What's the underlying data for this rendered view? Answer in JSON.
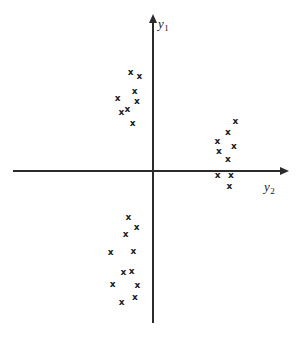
{
  "figure": {
    "background_color": "#ffffff",
    "axis_color": "#2b2b2b",
    "marker_color": "#1a1a1a",
    "marker_glyph": "x"
  },
  "axes": {
    "vertical": {
      "label": "y",
      "label_subscript": "1",
      "origin_x": 153,
      "top_y": 14,
      "bottom_y": 323,
      "arrow": "arrow-up"
    },
    "horizontal": {
      "label": "y",
      "label_subscript": "2",
      "origin_y": 171,
      "left_x": 13,
      "right_x": 288,
      "arrow": "arrow-right"
    }
  },
  "chart_data": {
    "type": "scatter",
    "title": "",
    "xlabel": "y2",
    "ylabel": "y1",
    "grid": false,
    "legend": "none",
    "xlim": [
      -140,
      135
    ],
    "ylim": [
      -152,
      157
    ],
    "axis_origin_px": [
      153,
      171
    ],
    "marker": "x",
    "series": [
      {
        "name": "upper-left-cluster",
        "quadrant": "II",
        "points_px": [
          [
            130.7,
            72.7
          ],
          [
            139.3,
            76.0
          ],
          [
            134.7,
            91.0
          ],
          [
            117.7,
            98.7
          ],
          [
            137.0,
            101.0
          ],
          [
            127.3,
            109.3
          ],
          [
            121.3,
            112.7
          ],
          [
            132.7,
            123.3
          ]
        ],
        "points": [
          [
            -22.3,
            98.3
          ],
          [
            -13.7,
            95.0
          ],
          [
            -18.3,
            80.0
          ],
          [
            -35.3,
            72.3
          ],
          [
            -16.0,
            70.0
          ],
          [
            -25.7,
            61.7
          ],
          [
            -31.7,
            58.3
          ],
          [
            -20.3,
            47.7
          ]
        ]
      },
      {
        "name": "right-cluster",
        "quadrant": "I and IV",
        "points_px": [
          [
            235.3,
            121.0
          ],
          [
            228.0,
            132.3
          ],
          [
            217.3,
            141.3
          ],
          [
            234.0,
            146.7
          ],
          [
            219.0,
            151.0
          ],
          [
            228.0,
            159.0
          ],
          [
            217.7,
            175.7
          ],
          [
            231.0,
            175.7
          ],
          [
            229.3,
            186.7
          ]
        ],
        "points": [
          [
            82.3,
            50.0
          ],
          [
            75.0,
            38.7
          ],
          [
            64.3,
            29.7
          ],
          [
            81.0,
            24.3
          ],
          [
            66.0,
            20.0
          ],
          [
            75.0,
            12.0
          ],
          [
            64.7,
            -4.7
          ],
          [
            78.0,
            -4.7
          ],
          [
            76.3,
            -15.7
          ]
        ]
      },
      {
        "name": "lower-left-cluster",
        "quadrant": "III",
        "points_px": [
          [
            128.3,
            217.3
          ],
          [
            136.7,
            227.3
          ],
          [
            125.7,
            234.0
          ],
          [
            110.7,
            252.7
          ],
          [
            133.3,
            251.7
          ],
          [
            123.3,
            272.7
          ],
          [
            131.7,
            271.7
          ],
          [
            112.7,
            284.0
          ],
          [
            137.3,
            285.0
          ],
          [
            135.0,
            297.7
          ],
          [
            121.7,
            302.7
          ]
        ],
        "points": [
          [
            -24.7,
            -46.3
          ],
          [
            -16.3,
            -56.3
          ],
          [
            -27.3,
            -63.0
          ],
          [
            -42.3,
            -81.7
          ],
          [
            -19.7,
            -80.7
          ],
          [
            -29.7,
            -101.7
          ],
          [
            -21.3,
            -100.7
          ],
          [
            -40.3,
            -113.0
          ],
          [
            -15.7,
            -114.0
          ],
          [
            -18.0,
            -126.7
          ],
          [
            -31.3,
            -131.7
          ]
        ]
      }
    ]
  }
}
